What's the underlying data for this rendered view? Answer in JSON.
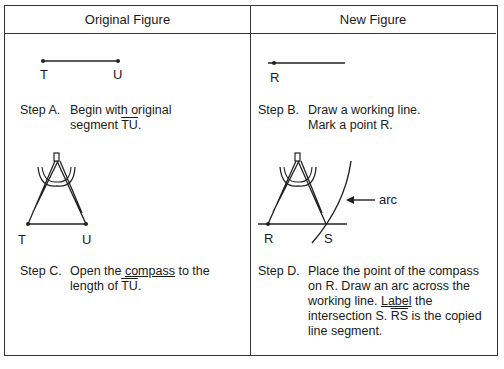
{
  "headers": {
    "left": "Original Figure",
    "right": "New Figure"
  },
  "figures": {
    "segment_tu": {
      "point1": "T",
      "point2": "U"
    },
    "working_line": {
      "point": "R"
    },
    "compass_tu": {
      "point1": "T",
      "point2": "U"
    },
    "compass_rs": {
      "point1": "R",
      "point2": "S",
      "arc_label": "arc"
    }
  },
  "steps": {
    "a": {
      "label": "Step A.",
      "line1": "Begin with original",
      "line2_pre": "segment ",
      "line2_over": "TU",
      "line2_post": "."
    },
    "b": {
      "label": "Step B.",
      "line1": "Draw a working line.",
      "line2": "Mark a point R."
    },
    "c": {
      "label": "Step C.",
      "line1_pre": "Open the ",
      "line1_ul": "compass",
      "line1_post": " to the",
      "line2_pre": "length of ",
      "line2_over": "TU",
      "line2_post": "."
    },
    "d": {
      "label": "Step D.",
      "line1": "Place the point of the compass",
      "line2": "on R. Draw an arc across the",
      "line3_pre": "working line. ",
      "line3_ul": "Label",
      "line3_post": " the",
      "line4_pre": "intersection S. ",
      "line4_over": "RS",
      "line4_post": " is the copied",
      "line5": "line segment."
    }
  }
}
